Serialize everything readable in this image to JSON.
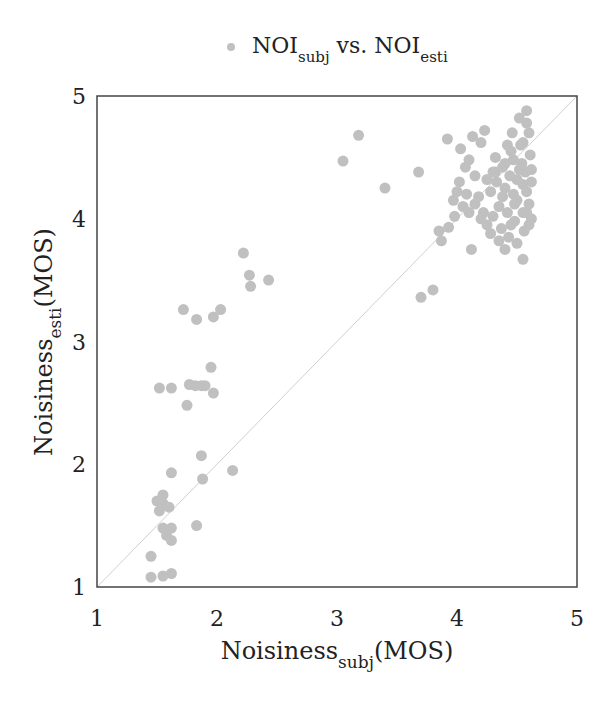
{
  "chart_data": {
    "type": "scatter",
    "title": "",
    "legend": {
      "position": "top-center",
      "entries": [
        {
          "name": "NOI_subj vs. NOI_esti",
          "base1": "NOI",
          "sub1": "subj",
          "mid": " vs. ",
          "base2": "NOI",
          "sub2": "esti",
          "color": "#c0c0c0"
        }
      ]
    },
    "xlabel": {
      "base": "Noisiness",
      "sub": "subj",
      "suffix": "(MOS)"
    },
    "ylabel": {
      "base": "Noisiness",
      "sub": "esti",
      "suffix": "(MOS)"
    },
    "xlim": [
      1,
      5
    ],
    "ylim": [
      1,
      5
    ],
    "xticks": [
      "1",
      "2",
      "3",
      "4",
      "5"
    ],
    "yticks": [
      "1",
      "2",
      "3",
      "4",
      "5"
    ],
    "grid": false,
    "reference_line": {
      "from": [
        1,
        1
      ],
      "to": [
        5,
        5
      ],
      "color": "#cfcfcf"
    },
    "marker_color": "#c0c0c0",
    "series": [
      {
        "name": "NOI_subj vs. NOI_esti",
        "points": [
          [
            1.45,
            1.08
          ],
          [
            1.55,
            1.09
          ],
          [
            1.62,
            1.11
          ],
          [
            1.45,
            1.25
          ],
          [
            1.62,
            1.38
          ],
          [
            1.58,
            1.42
          ],
          [
            1.55,
            1.48
          ],
          [
            1.62,
            1.48
          ],
          [
            1.83,
            1.5
          ],
          [
            1.52,
            1.62
          ],
          [
            1.55,
            1.68
          ],
          [
            1.6,
            1.65
          ],
          [
            1.5,
            1.7
          ],
          [
            1.55,
            1.75
          ],
          [
            1.62,
            1.93
          ],
          [
            1.88,
            1.88
          ],
          [
            2.13,
            1.95
          ],
          [
            1.87,
            2.07
          ],
          [
            1.52,
            2.62
          ],
          [
            1.62,
            2.62
          ],
          [
            1.77,
            2.65
          ],
          [
            1.82,
            2.64
          ],
          [
            1.87,
            2.64
          ],
          [
            1.9,
            2.64
          ],
          [
            1.97,
            2.58
          ],
          [
            1.75,
            2.48
          ],
          [
            1.95,
            2.79
          ],
          [
            1.72,
            3.26
          ],
          [
            1.83,
            3.18
          ],
          [
            1.97,
            3.2
          ],
          [
            2.03,
            3.26
          ],
          [
            2.22,
            3.72
          ],
          [
            2.27,
            3.54
          ],
          [
            2.28,
            3.45
          ],
          [
            2.43,
            3.5
          ],
          [
            3.05,
            4.47
          ],
          [
            3.18,
            4.68
          ],
          [
            3.4,
            4.25
          ],
          [
            3.7,
            3.36
          ],
          [
            3.8,
            3.42
          ],
          [
            3.68,
            4.38
          ],
          [
            3.85,
            3.9
          ],
          [
            3.87,
            3.82
          ],
          [
            3.93,
            3.93
          ],
          [
            3.97,
            4.15
          ],
          [
            4.02,
            4.3
          ],
          [
            4.07,
            4.42
          ],
          [
            4.1,
            4.05
          ],
          [
            4.12,
            3.75
          ],
          [
            3.92,
            4.65
          ],
          [
            4.03,
            4.57
          ],
          [
            4.1,
            4.48
          ],
          [
            4.13,
            4.67
          ],
          [
            4.2,
            4.62
          ],
          [
            4.23,
            4.72
          ],
          [
            4.15,
            4.35
          ],
          [
            4.18,
            4.18
          ],
          [
            4.22,
            4.05
          ],
          [
            4.25,
            3.95
          ],
          [
            4.28,
            4.22
          ],
          [
            4.3,
            4.38
          ],
          [
            4.32,
            4.5
          ],
          [
            4.33,
            4.3
          ],
          [
            4.35,
            4.1
          ],
          [
            4.37,
            3.92
          ],
          [
            4.38,
            4.42
          ],
          [
            4.4,
            4.25
          ],
          [
            4.42,
            4.05
          ],
          [
            4.43,
            3.85
          ],
          [
            4.44,
            4.35
          ],
          [
            4.45,
            4.55
          ],
          [
            4.46,
            4.7
          ],
          [
            4.47,
            4.2
          ],
          [
            4.48,
            3.98
          ],
          [
            4.5,
            4.32
          ],
          [
            4.5,
            4.15
          ],
          [
            4.52,
            4.82
          ],
          [
            4.53,
            4.6
          ],
          [
            4.54,
            4.45
          ],
          [
            4.55,
            4.28
          ],
          [
            4.55,
            4.05
          ],
          [
            4.56,
            3.9
          ],
          [
            4.57,
            4.38
          ],
          [
            4.58,
            4.22
          ],
          [
            4.58,
            4.88
          ],
          [
            4.6,
            4.12
          ],
          [
            4.6,
            4.7
          ],
          [
            4.61,
            4.52
          ],
          [
            4.62,
            4.3
          ],
          [
            4.62,
            4.0
          ],
          [
            4.55,
            3.67
          ],
          [
            4.5,
            3.8
          ],
          [
            4.4,
            3.75
          ],
          [
            4.35,
            3.82
          ],
          [
            4.28,
            3.88
          ],
          [
            4.2,
            4.0
          ],
          [
            4.05,
            4.1
          ],
          [
            4.0,
            4.22
          ],
          [
            3.98,
            4.02
          ],
          [
            4.08,
            4.2
          ],
          [
            4.3,
            4.02
          ],
          [
            4.45,
            3.95
          ],
          [
            4.52,
            4.4
          ],
          [
            4.47,
            4.48
          ],
          [
            4.42,
            4.6
          ],
          [
            4.55,
            4.62
          ],
          [
            4.58,
            4.78
          ],
          [
            4.62,
            4.4
          ],
          [
            4.48,
            4.12
          ],
          [
            4.38,
            4.18
          ],
          [
            4.25,
            4.32
          ],
          [
            4.15,
            4.12
          ],
          [
            4.32,
            4.38
          ],
          [
            4.4,
            4.45
          ],
          [
            4.58,
            4.05
          ],
          [
            4.6,
            3.95
          ]
        ]
      }
    ]
  }
}
